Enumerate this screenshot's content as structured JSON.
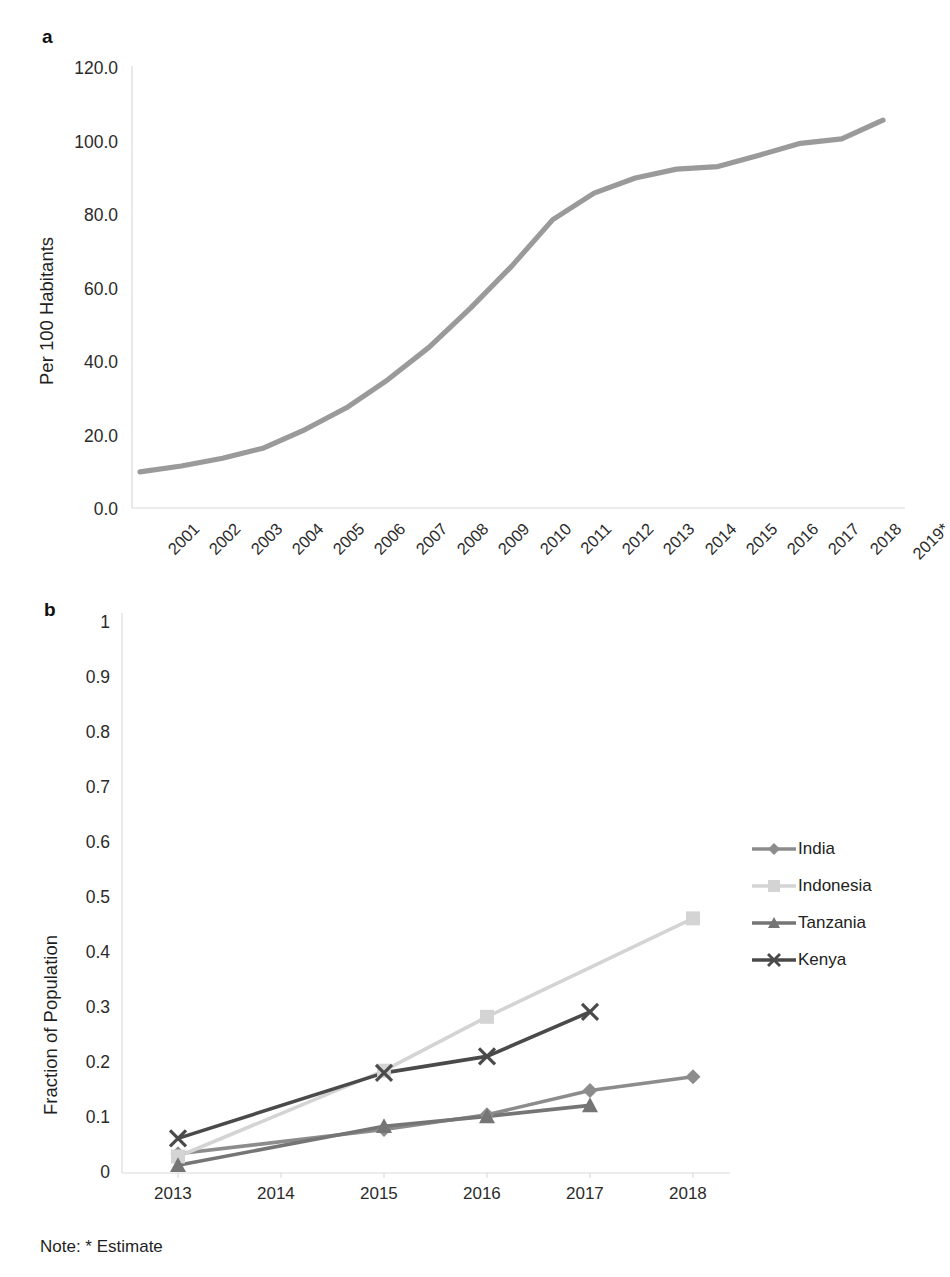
{
  "figure": {
    "note": "Note: * Estimate",
    "panel_a_letter": "a",
    "panel_b_letter": "b"
  },
  "legend": {
    "items": [
      {
        "label": "India",
        "marker": "diamond-marker",
        "color": "#8c8c8c"
      },
      {
        "label": "Indonesia",
        "marker": "square-marker",
        "color": "#d4d4d4"
      },
      {
        "label": "Tanzania",
        "marker": "triangle-marker",
        "color": "#757575"
      },
      {
        "label": "Kenya",
        "marker": "x-marker",
        "color": "#4a4a4a"
      }
    ]
  },
  "chart_data": [
    {
      "id": "panel-a",
      "type": "line",
      "title": "",
      "xlabel": "",
      "ylabel": "Per 100 Habitants",
      "ylim": [
        0,
        120
      ],
      "yticks": [
        "0.0",
        "20.0",
        "40.0",
        "60.0",
        "80.0",
        "100.0",
        "120.0"
      ],
      "ytick_values": [
        0,
        20,
        40,
        60,
        80,
        100,
        120
      ],
      "grid": false,
      "categories": [
        "2001",
        "2002",
        "2003",
        "2004",
        "2005",
        "2006",
        "2007",
        "2008",
        "2009",
        "2010",
        "2011",
        "2012",
        "2013",
        "2014",
        "2015",
        "2016",
        "2017",
        "2018",
        "2019*"
      ],
      "series": [
        {
          "name": "Mobile cellular subscriptions per 100 habitants",
          "color": "#9a9a9a",
          "values": [
            9.8,
            11.4,
            13.5,
            16.3,
            21.3,
            27.2,
            34.8,
            43.6,
            54.2,
            65.6,
            78.3,
            85.5,
            89.6,
            92.0,
            92.7,
            95.8,
            99.0,
            100.2,
            105.3
          ]
        }
      ]
    },
    {
      "id": "panel-b",
      "type": "line",
      "title": "",
      "xlabel": "",
      "ylabel": "Fraction of Population",
      "ylim": [
        0,
        1
      ],
      "yticks": [
        "0",
        "0.1",
        "0.2",
        "0.3",
        "0.4",
        "0.5",
        "0.6",
        "0.7",
        "0.8",
        "0.9",
        "1"
      ],
      "ytick_values": [
        0,
        0.1,
        0.2,
        0.3,
        0.4,
        0.5,
        0.6,
        0.7,
        0.8,
        0.9,
        1
      ],
      "grid": false,
      "categories": [
        "2013",
        "2014",
        "2015",
        "2016",
        "2017",
        "2018"
      ],
      "series": [
        {
          "name": "India",
          "color": "#8c8c8c",
          "marker": "diamond-marker",
          "x": [
            "2013",
            "2015",
            "2016",
            "2017",
            "2018"
          ],
          "values": [
            0.035,
            0.079,
            0.106,
            0.15,
            0.175
          ]
        },
        {
          "name": "Indonesia",
          "color": "#d4d4d4",
          "marker": "square-marker",
          "x": [
            "2013",
            "2015",
            "2016",
            "2018"
          ],
          "values": [
            0.03,
            0.186,
            0.284,
            0.463
          ]
        },
        {
          "name": "Tanzania",
          "color": "#757575",
          "marker": "triangle-marker",
          "x": [
            "2013",
            "2015",
            "2016",
            "2017"
          ],
          "values": [
            0.014,
            0.085,
            0.103,
            0.123
          ]
        },
        {
          "name": "Kenya",
          "color": "#4a4a4a",
          "marker": "x-marker",
          "x": [
            "2013",
            "2015",
            "2016",
            "2017"
          ],
          "values": [
            0.063,
            0.182,
            0.212,
            0.293
          ]
        }
      ]
    }
  ]
}
